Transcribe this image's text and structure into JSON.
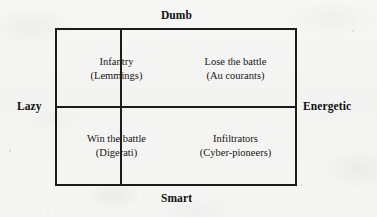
{
  "diagram": {
    "type": "2x2-matrix",
    "axes": {
      "top_label": "Dumb",
      "bottom_label": "Smart",
      "left_label": "Lazy",
      "right_label": "Energetic"
    },
    "quadrants": [
      {
        "position": "top-left",
        "title": "Infantry",
        "subtitle": "(Lemmings)"
      },
      {
        "position": "top-right",
        "title": "Lose the battle",
        "subtitle": "(Au courants)"
      },
      {
        "position": "bottom-left",
        "title": "Win the battle",
        "subtitle": "(Digerati)"
      },
      {
        "position": "bottom-right",
        "title": "Infiltrators",
        "subtitle": "(Cyber-pioneers)"
      }
    ],
    "colors": {
      "line": "#1c1c1c",
      "text": "#141414",
      "background": "#f4f4f3"
    }
  }
}
